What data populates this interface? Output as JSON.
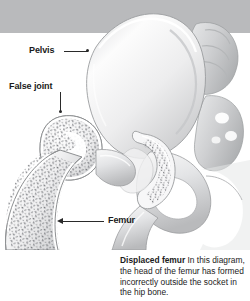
{
  "figure": {
    "type": "medical-anatomical-illustration",
    "view": "coronal cross-section of right hip",
    "style": "grayscale stippled line art"
  },
  "bands": {
    "top_band_color": "#b9babc"
  },
  "labels": [
    {
      "id": "pelvis",
      "text": "Pelvis",
      "leader": "horizontal-line-with-dot",
      "points_to": "iliac wing of the pelvis"
    },
    {
      "id": "false-joint",
      "text": "False joint",
      "leader": "vertical-line-with-dot",
      "points_to": "displaced femoral head resting on the ilium"
    },
    {
      "id": "femur",
      "text": "Femur",
      "leader": "horizontal-line-with-left-arrowhead",
      "points_to": "femoral shaft"
    }
  ],
  "caption": {
    "lead": "Displaced femur",
    "body": " In this diagram, the head of the femur has formed incorrectly outside the socket in the hip bone."
  },
  "anatomy": {
    "structures": [
      "pelvis",
      "ilium",
      "acetabulum (empty socket)",
      "femoral head",
      "femoral neck",
      "femoral shaft",
      "sacrum",
      "pubis",
      "ischium"
    ]
  },
  "colors": {
    "background": "#ffffff",
    "bone_light": "#f4f4f5",
    "bone_mid": "#d8d9db",
    "bone_shadow": "#a9abad",
    "outline": "#8f9193",
    "stipple": "#6e7073",
    "text": "#1b1b1b",
    "leader": "#2a2a2a"
  }
}
